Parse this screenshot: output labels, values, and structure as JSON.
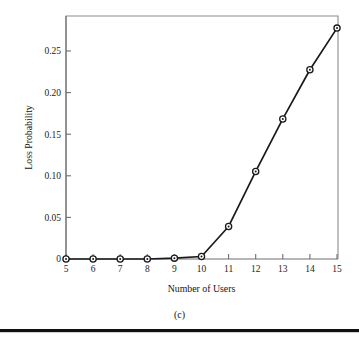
{
  "figure": {
    "caption": "(c)"
  },
  "chart_data": {
    "type": "line",
    "title": "",
    "xlabel": "Number of Users",
    "ylabel": "Loss Probability",
    "x": [
      5,
      6,
      7,
      8,
      9,
      10,
      11,
      12,
      13,
      14,
      15
    ],
    "values": [
      0,
      0,
      0,
      0,
      0.001,
      0.003,
      0.039,
      0.105,
      0.168,
      0.227,
      0.277
    ],
    "series": [
      {
        "name": "Loss Probability",
        "values": [
          0,
          0,
          0,
          0,
          0.001,
          0.003,
          0.039,
          0.105,
          0.168,
          0.227,
          0.277
        ]
      }
    ],
    "xlim": [
      5,
      15
    ],
    "ylim": [
      0,
      0.2915
    ],
    "xticks": [
      5,
      6,
      7,
      8,
      9,
      10,
      11,
      12,
      13,
      14,
      15
    ],
    "xtick_labels": [
      "5",
      "6",
      "7",
      "8",
      "9",
      "10",
      "11",
      "12",
      "13",
      "14",
      "15"
    ],
    "yticks": [
      0,
      0.05,
      0.1,
      0.15,
      0.2,
      0.25
    ],
    "ytick_labels": [
      "0",
      "0.05",
      "0.10",
      "0.15",
      "0.20",
      "0.25"
    ],
    "grid": false,
    "legend": false,
    "marker": "circle-with-dot",
    "line_color": "#1a1a1a",
    "marker_face_color": "#ffffff",
    "frame_color": "#8c8c8c"
  }
}
